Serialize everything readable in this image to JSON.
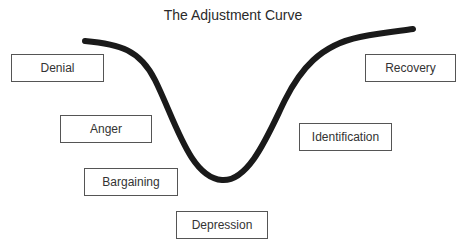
{
  "diagram": {
    "title": "The Adjustment Curve",
    "stages": [
      {
        "id": "denial",
        "label": "Denial"
      },
      {
        "id": "anger",
        "label": "Anger"
      },
      {
        "id": "bargaining",
        "label": "Bargaining"
      },
      {
        "id": "depression",
        "label": "Depression"
      },
      {
        "id": "identification",
        "label": "Identification"
      },
      {
        "id": "recovery",
        "label": "Recovery"
      }
    ],
    "curve_color": "#1a1a1a",
    "box_border_color": "#555555"
  }
}
